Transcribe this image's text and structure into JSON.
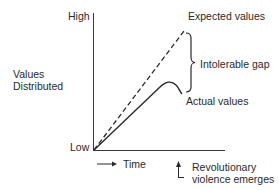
{
  "diagram": {
    "y_axis": {
      "title_line1": "Values",
      "title_line2": "Distributed",
      "high_label": "High",
      "low_label": "Low"
    },
    "x_axis": {
      "label": "Time",
      "arrow": "right-arrow-icon"
    },
    "series": {
      "expected": {
        "label": "Expected values",
        "style": "dashed",
        "color": "#2a2a2a"
      },
      "actual": {
        "label": "Actual values",
        "style": "solid",
        "color": "#2a2a2a"
      }
    },
    "gap_label": "Intolerable gap",
    "event": {
      "label_line1": "Revolutionary",
      "label_line2": "violence emerges"
    }
  }
}
